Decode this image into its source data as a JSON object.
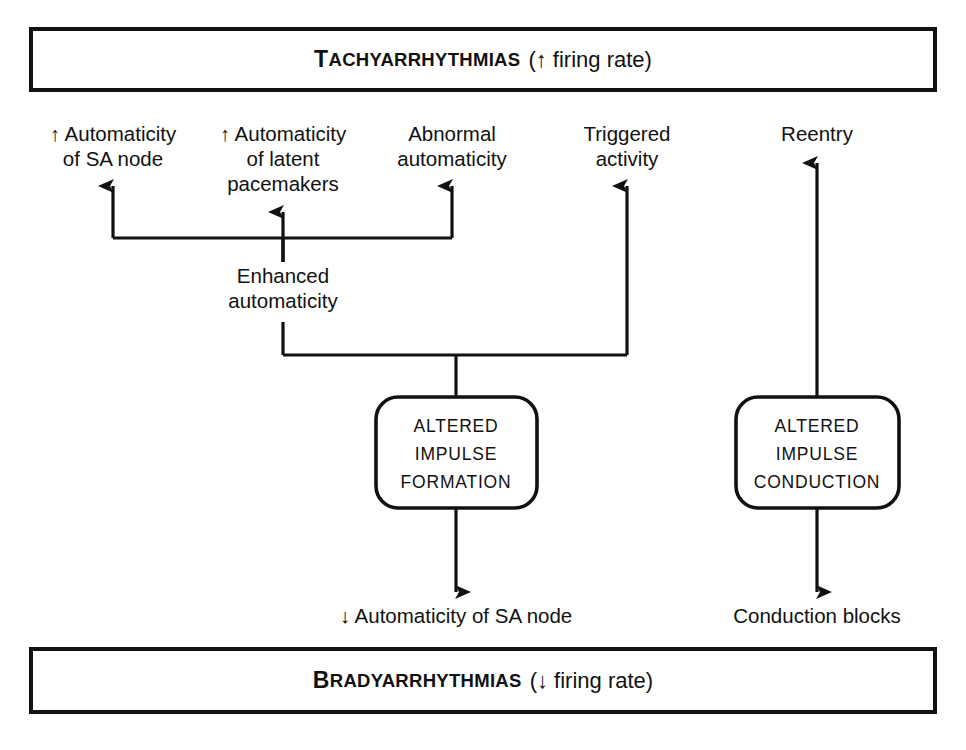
{
  "figure": {
    "title_top": "TACHYARRHYTHMIAS (↑ firing rate)",
    "title_bottom": "BRADYARRHYTHMIAS (↓ firing rate)"
  },
  "banners": {
    "top": {
      "caps_lead": "T",
      "caps_rest": "ACHYARRHYTHMIAS",
      "paren": "(↑ firing rate)"
    },
    "bottom": {
      "caps_lead": "B",
      "caps_rest": "RADYARRHYTHMIAS",
      "paren": "(↓ firing rate)"
    }
  },
  "mechanisms": [
    {
      "id": "automaticity-sa-node",
      "line1": "↑ Automaticity",
      "line2": "of SA node",
      "line3": ""
    },
    {
      "id": "automaticity-latent-pacemakers",
      "line1": "↑ Automaticity",
      "line2": "of latent",
      "line3": "pacemakers"
    },
    {
      "id": "abnormal-automaticity",
      "line1": "Abnormal",
      "line2": "automaticity",
      "line3": ""
    },
    {
      "id": "triggered-activity",
      "line1": "Triggered",
      "line2": "activity",
      "line3": ""
    },
    {
      "id": "reentry",
      "line1": "Reentry",
      "line2": "",
      "line3": ""
    }
  ],
  "enhanced_automaticity": {
    "line1": "Enhanced",
    "line2": "automaticity"
  },
  "process_boxes": [
    {
      "id": "altered-impulse-formation",
      "line1": "ALTERED",
      "line2": "IMPULSE",
      "line3": "FORMATION"
    },
    {
      "id": "altered-impulse-conduction",
      "line1": "ALTERED",
      "line2": "IMPULSE",
      "line3": "CONDUCTION"
    }
  ],
  "outcomes": [
    {
      "id": "decreased-automaticity-sa-node",
      "label": "↓ Automaticity of SA node"
    },
    {
      "id": "conduction-blocks",
      "label": "Conduction blocks"
    }
  ],
  "colors": {
    "ink": "#111111",
    "background": "#ffffff"
  }
}
